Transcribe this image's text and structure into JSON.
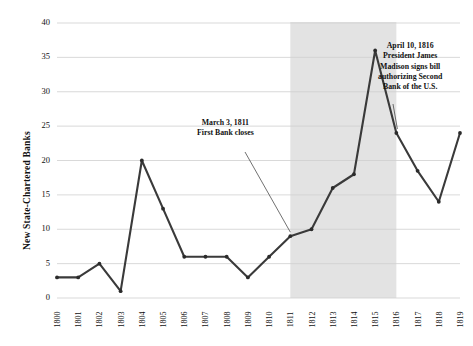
{
  "chart_data": {
    "type": "line",
    "title": "",
    "xlabel": "",
    "ylabel": "New State-Chartered Banks",
    "x": [
      1800,
      1801,
      1802,
      1803,
      1804,
      1805,
      1806,
      1807,
      1808,
      1809,
      1810,
      1811,
      1812,
      1813,
      1814,
      1815,
      1816,
      1817,
      1818,
      1819
    ],
    "values": [
      3,
      3,
      5,
      1,
      20,
      13,
      6,
      6,
      6,
      3,
      6,
      9,
      10,
      16,
      18,
      36,
      24,
      18.5,
      14,
      24
    ],
    "xtick_labels": [
      "1800",
      "1801",
      "1802",
      "1803",
      "1804",
      "1805",
      "1806",
      "1807",
      "1808",
      "1809",
      "1810",
      "1811",
      "1812",
      "1813",
      "1814",
      "1815",
      "1816",
      "1817",
      "1818",
      "1819"
    ],
    "ytick_labels": [
      "0",
      "5",
      "10",
      "15",
      "20",
      "25",
      "30",
      "35",
      "40"
    ],
    "ytick_values": [
      0,
      5,
      10,
      15,
      20,
      25,
      30,
      35,
      40
    ],
    "ylim": [
      0,
      40
    ],
    "xlim": [
      1800,
      1819
    ],
    "grid": true,
    "legend": "none",
    "line_color": "#3a3a3a",
    "marker_color": "#2b2b2b",
    "grid_color": "#cfcfcf",
    "shaded_band": {
      "label": "no-national-bank-period",
      "x_start": 1811,
      "x_end": 1816,
      "color": "#e3e3e3"
    },
    "annotations": [
      {
        "name": "first-bank-closes",
        "lines": [
          "March 3, 1811",
          "First Bank closes"
        ],
        "target_x": 1811,
        "target_y": 9
      },
      {
        "name": "second-bank-authorized",
        "lines": [
          "April 10, 1816",
          "President James",
          "Madison signs bill",
          "authorizing Second",
          "Bank of the U.S."
        ],
        "target_x": 1816,
        "target_y": 24
      }
    ]
  }
}
